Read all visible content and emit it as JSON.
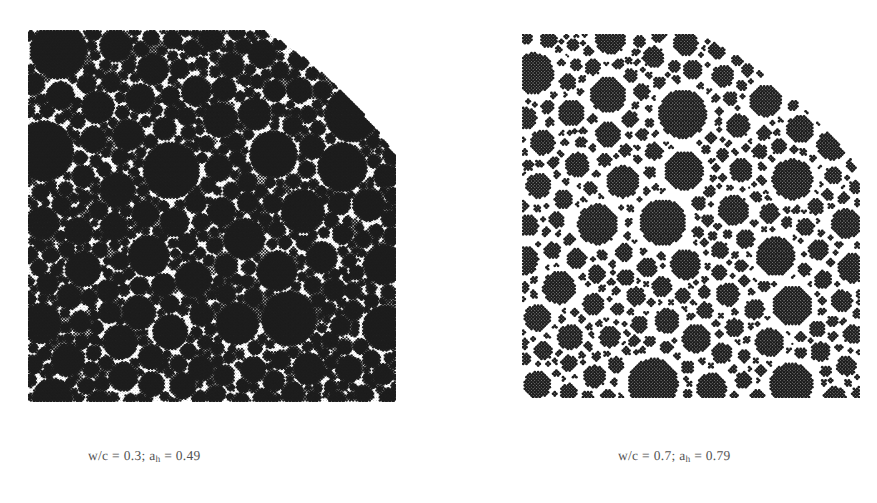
{
  "figure": {
    "type": "simulated-cement-paste-microstructure-pair",
    "background_color": "#ffffff",
    "ink_color": "#1d1d1d",
    "caption_color": "#3a3a3a",
    "rendering": "halftone-screened-print-scan"
  },
  "panels": [
    {
      "id": "left",
      "name": "microstructure-low-water-cement-ratio",
      "caption": {
        "full_text": "w/c = 0.3; aₕ = 0.49",
        "prefix": "w/c = 0.3; a",
        "subscript": "h",
        "suffix": " = 0.49"
      },
      "parameters": {
        "wc_label": "w/c",
        "wc_value": "0.3",
        "alpha_label": "a",
        "alpha_subscript": "h",
        "alpha_value": "0.49"
      },
      "appearance": {
        "matrix_color": "#ffffff",
        "particle_color": "#242424",
        "secondary_product_color": "#6a6a6a",
        "has_white_halos": false,
        "matrix_description": "white-unfilled-capillary-porosity-low"
      },
      "shape": {
        "outline": "square-with-quarter-circle-cut-at-top-right",
        "arc_corner": "top-right"
      }
    },
    {
      "id": "right",
      "name": "microstructure-high-water-cement-ratio",
      "caption": {
        "full_text": "w/c = 0.7; aₕ = 0.79",
        "prefix": "w/c = 0.7; a",
        "subscript": "h",
        "suffix": " = 0.79"
      },
      "parameters": {
        "wc_label": "w/c",
        "wc_value": "0.7",
        "alpha_label": "a",
        "alpha_subscript": "h",
        "alpha_value": "0.79"
      },
      "appearance": {
        "matrix_color": "#5d5d5d",
        "particle_color": "#303030",
        "halo_color": "#ffffff",
        "has_white_halos": true,
        "matrix_description": "grey-hydration-product-matrix-with-white-rims"
      },
      "shape": {
        "outline": "square-with-quarter-circle-cut-at-top-right",
        "arc_corner": "top-right"
      }
    }
  ]
}
